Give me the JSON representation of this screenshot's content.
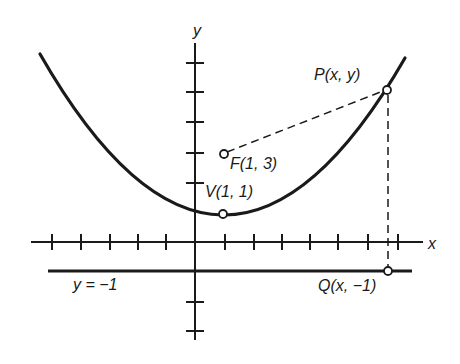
{
  "diagram": {
    "axes": {
      "x_label": "x",
      "y_label": "y"
    },
    "labels": {
      "focus": "F(1, 3)",
      "vertex": "V(1, 1)",
      "point": "P(x, y)",
      "projection": "Q(x, −1)",
      "directrix": "y = −1"
    },
    "points": [
      {
        "name": "F",
        "coords": [
          1,
          3
        ]
      },
      {
        "name": "V",
        "coords": [
          1,
          1
        ]
      },
      {
        "name": "P",
        "coords": [
          "x",
          "y"
        ]
      },
      {
        "name": "Q",
        "coords": [
          "x",
          -1
        ]
      }
    ],
    "colors": {
      "ink": "#1a1a1a",
      "background": "#ffffff"
    }
  }
}
